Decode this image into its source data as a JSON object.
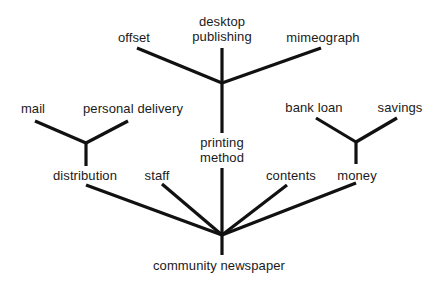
{
  "diagram": {
    "type": "tree",
    "root": "community newspaper",
    "line_color": "#111111",
    "nodes": [
      {
        "id": "root",
        "label": "community newspaper"
      },
      {
        "id": "distribution",
        "label": "distribution",
        "parent": "root"
      },
      {
        "id": "staff",
        "label": "staff",
        "parent": "root"
      },
      {
        "id": "printing",
        "label": "printing method",
        "parent": "root"
      },
      {
        "id": "contents",
        "label": "contents",
        "parent": "root"
      },
      {
        "id": "money",
        "label": "money",
        "parent": "root"
      },
      {
        "id": "mail",
        "label": "mail",
        "parent": "distribution"
      },
      {
        "id": "personal",
        "label": "personal delivery",
        "parent": "distribution"
      },
      {
        "id": "offset",
        "label": "offset",
        "parent": "printing"
      },
      {
        "id": "desktop",
        "label": "desktop publishing",
        "parent": "printing"
      },
      {
        "id": "mimeo",
        "label": "mimeograph",
        "parent": "printing"
      },
      {
        "id": "bank",
        "label": "bank loan",
        "parent": "money"
      },
      {
        "id": "savings",
        "label": "savings",
        "parent": "money"
      }
    ]
  },
  "labels": {
    "root": "community newspaper",
    "distribution": "distribution",
    "staff": "staff",
    "printing_line1": "printing",
    "printing_line2": "method",
    "contents": "contents",
    "money": "money",
    "mail": "mail",
    "personal_delivery": "personal delivery",
    "offset": "offset",
    "desktop_line1": "desktop",
    "desktop_line2": "publishing",
    "mimeograph": "mimeograph",
    "bank_loan": "bank loan",
    "savings": "savings"
  }
}
